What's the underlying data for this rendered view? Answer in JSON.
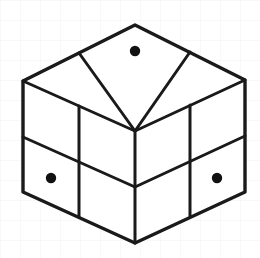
{
  "canvas": {
    "width": 260,
    "height": 258,
    "background_color": "#ffffff",
    "title": "Isometric 2x2x2 cube with three marked dots"
  },
  "background_grid": {
    "visible": true,
    "spacing": 20,
    "color": "#f2f2f4",
    "line_width": 1
  },
  "figure": {
    "name": "isometric-cube",
    "type": "2x2x2 cube",
    "stroke_color": "#1a1a1a",
    "fill_color": "#ffffff",
    "outer_stroke_width": 3.4,
    "inner_stroke_width": 3.0,
    "vertices": {
      "top_apex": [
        135,
        25
      ],
      "left_top": [
        23,
        81
      ],
      "right_top": [
        245,
        80
      ],
      "center_front_top": [
        135,
        131
      ],
      "left_bottom": [
        23,
        192
      ],
      "right_bottom": [
        245,
        192
      ],
      "bottom_front": [
        135,
        243
      ],
      "top_left_mid": [
        79,
        53
      ],
      "top_right_mid": [
        190,
        52
      ],
      "top_back_mid_left": [
        79,
        105
      ],
      "top_back_mid_right": [
        190,
        105
      ]
    },
    "outline_path": "M135,25 L245,80 L245,192 L135,243 L23,192 L23,81 Z",
    "faces": [
      {
        "name": "top-face",
        "cells": [
          {
            "name": "top-cell-back",
            "path": "M135,25 L190,52 L135,79 L79,53 Z",
            "dot": false
          },
          {
            "name": "top-cell-left",
            "path": "M79,53 L135,79 L135,131 L23,81 Z",
            "dot": false
          },
          {
            "name": "top-cell-right",
            "path": "M190,52 L245,80 L135,131 L135,79 Z",
            "dot": false
          },
          {
            "name": "top-cell-front",
            "path": "M135,79 L135,131 L135,131 L135,79 Z",
            "dot": false
          }
        ]
      },
      {
        "name": "left-face",
        "cells": [
          {
            "name": "left-cell-top-outer",
            "dot": false
          },
          {
            "name": "left-cell-top-inner",
            "dot": false
          },
          {
            "name": "left-cell-bottom-outer",
            "dot": true
          },
          {
            "name": "left-cell-bottom-inner",
            "dot": false
          }
        ]
      },
      {
        "name": "right-face",
        "cells": [
          {
            "name": "right-cell-top-inner",
            "dot": false
          },
          {
            "name": "right-cell-top-outer",
            "dot": false
          },
          {
            "name": "right-cell-bottom-inner",
            "dot": false
          },
          {
            "name": "right-cell-bottom-outer",
            "dot": true
          }
        ]
      }
    ],
    "edges": [
      {
        "name": "edge-outline-top-right",
        "from": [
          135,
          25
        ],
        "to": [
          245,
          80
        ],
        "kind": "outer"
      },
      {
        "name": "edge-outline-right-down",
        "from": [
          245,
          80
        ],
        "to": [
          245,
          192
        ],
        "kind": "outer"
      },
      {
        "name": "edge-outline-right-bottom",
        "from": [
          245,
          192
        ],
        "to": [
          135,
          243
        ],
        "kind": "outer"
      },
      {
        "name": "edge-outline-left-bottom",
        "from": [
          135,
          243
        ],
        "to": [
          23,
          192
        ],
        "kind": "outer"
      },
      {
        "name": "edge-outline-left-up",
        "from": [
          23,
          192
        ],
        "to": [
          23,
          81
        ],
        "kind": "outer"
      },
      {
        "name": "edge-outline-top-left",
        "from": [
          23,
          81
        ],
        "to": [
          135,
          25
        ],
        "kind": "outer"
      },
      {
        "name": "edge-top-divider-a",
        "from": [
          79,
          53
        ],
        "to": [
          135,
          131
        ],
        "kind": "inner"
      },
      {
        "name": "edge-top-divider-b",
        "from": [
          190,
          52
        ],
        "to": [
          135,
          131
        ],
        "kind": "inner"
      },
      {
        "name": "edge-top-divider-c",
        "from": [
          23,
          81
        ],
        "to": [
          135,
          131
        ],
        "kind": "inner"
      },
      {
        "name": "edge-top-divider-d",
        "from": [
          245,
          80
        ],
        "to": [
          135,
          131
        ],
        "kind": "inner"
      },
      {
        "name": "edge-vertical-center",
        "from": [
          135,
          131
        ],
        "to": [
          135,
          243
        ],
        "kind": "inner"
      },
      {
        "name": "edge-left-vertical-mid",
        "from": [
          79,
          105
        ],
        "to": [
          79,
          216
        ],
        "kind": "inner"
      },
      {
        "name": "edge-right-vertical-mid",
        "from": [
          190,
          105
        ],
        "to": [
          190,
          216
        ],
        "kind": "inner"
      },
      {
        "name": "edge-left-horiz-mid",
        "from": [
          23,
          137
        ],
        "to": [
          135,
          187
        ],
        "kind": "inner"
      },
      {
        "name": "edge-right-horiz-mid",
        "from": [
          135,
          187
        ],
        "to": [
          245,
          136
        ],
        "kind": "inner"
      }
    ],
    "dots": [
      {
        "name": "dot-top-face",
        "cx": 135,
        "cy": 51,
        "r": 5.2,
        "color": "#111111",
        "face": "top",
        "cell": "back"
      },
      {
        "name": "dot-left-face",
        "cx": 51,
        "cy": 178,
        "r": 5.2,
        "color": "#111111",
        "face": "left",
        "cell": "bottom-outer"
      },
      {
        "name": "dot-right-face",
        "cx": 217,
        "cy": 178,
        "r": 5.2,
        "color": "#111111",
        "face": "right",
        "cell": "bottom-outer"
      }
    ],
    "dot_count": 3
  }
}
